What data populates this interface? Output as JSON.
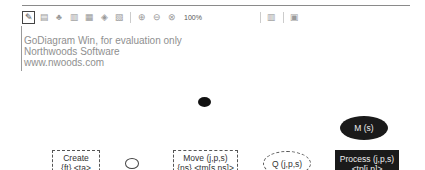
{
  "toolbar": {
    "zoom_level": "100%",
    "buttons": [
      "pointer-tool",
      "align-left",
      "align-center",
      "align-right",
      "align-top",
      "align-middle",
      "align-bottom",
      "zoom-in",
      "zoom-out",
      "zoom-fit",
      "grid",
      "layout"
    ]
  },
  "watermark": {
    "line1": "GoDiagram Win, for evaluation only",
    "line2": "Northwoods Software",
    "line3": "www.nwoods.com"
  },
  "diagram": {
    "nodes": [
      {
        "id": "create",
        "label1": "Create",
        "label2": "{ft} <ta>"
      },
      {
        "id": "move",
        "label1": "Move (j,p,s)",
        "label2": "{ns} <tm[s,ns]>"
      },
      {
        "id": "q",
        "label1": "Q (j,p,s)"
      },
      {
        "id": "process",
        "label1": "Process (j,p,s)",
        "label2": "<tp[j,p]>"
      },
      {
        "id": "m",
        "label1": "M (s)"
      }
    ]
  }
}
